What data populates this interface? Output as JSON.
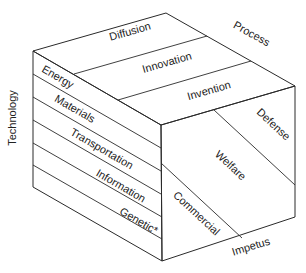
{
  "diagram": {
    "axes": {
      "technology": "Technology",
      "process": "Process",
      "impetus": "Impetus"
    },
    "process_levels": [
      "Diffusion",
      "Innovation",
      "Invention"
    ],
    "technology_categories": [
      "Energy",
      "Materials",
      "Transportation",
      "Information",
      "Genetic*"
    ],
    "impetus_categories": [
      "Defense",
      "Welfare",
      "Commercial"
    ],
    "colors": {
      "line": "#2a2a2a",
      "text": "#222222",
      "background": "#ffffff"
    }
  }
}
